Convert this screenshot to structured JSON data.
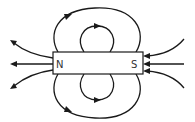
{
  "diagram": {
    "magnet": {
      "north_label": "N",
      "south_label": "S"
    },
    "colors": {
      "stroke": "#1a1a1a",
      "label": "#333333",
      "background": "#ffffff"
    },
    "field_lines": [
      {
        "id": "outer-top-loop",
        "from": "N",
        "to": "S",
        "direction": "clockwise"
      },
      {
        "id": "inner-top-loop",
        "from": "N",
        "to": "S",
        "direction": "clockwise"
      },
      {
        "id": "outer-bottom-loop",
        "from": "N",
        "to": "S",
        "direction": "counter-clockwise"
      },
      {
        "id": "inner-bottom-loop",
        "from": "N",
        "to": "S",
        "direction": "counter-clockwise"
      },
      {
        "id": "left-upper-line",
        "direction": "outward-from-N"
      },
      {
        "id": "left-middle-line",
        "direction": "outward-from-N"
      },
      {
        "id": "left-lower-line",
        "direction": "outward-from-N"
      },
      {
        "id": "right-upper-line",
        "direction": "inward-to-S"
      },
      {
        "id": "right-middle-line",
        "direction": "inward-to-S"
      },
      {
        "id": "right-lower-line",
        "direction": "inward-to-S"
      }
    ]
  }
}
